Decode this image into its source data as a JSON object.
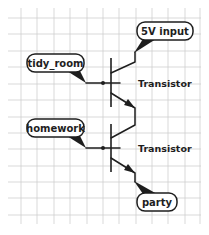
{
  "diagram": {
    "type": "transistor_logic_circuit",
    "colors": {
      "line": "#1e1e1e",
      "grid": "#cfcfcf",
      "background": "#ffffff"
    },
    "nodes": {
      "supply": {
        "label": "5V input"
      },
      "input_a": {
        "label": "tidy_room"
      },
      "input_b": {
        "label": "homework"
      },
      "output": {
        "label": "party"
      }
    },
    "components": [
      {
        "id": "transistor_1",
        "label": "Transistor",
        "base": "tidy_room",
        "collector": "5V input",
        "emitter": "transistor_2.collector"
      },
      {
        "id": "transistor_2",
        "label": "Transistor",
        "base": "homework",
        "collector": "transistor_1.emitter",
        "emitter": "party"
      }
    ],
    "icons": {
      "dot": "junction-dot",
      "arrow": "emitter-arrow"
    }
  }
}
